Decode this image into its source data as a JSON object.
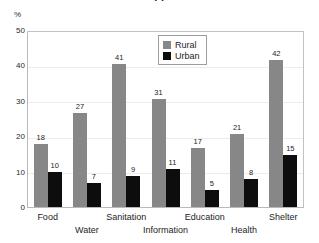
{
  "title_partial": "· ·",
  "axis": {
    "unit_label": "%",
    "y_ticks": [
      "50",
      "40",
      "30",
      "20",
      "10",
      "0"
    ]
  },
  "legend": {
    "position": "inside-top-center",
    "entries": [
      {
        "label": "Rural",
        "color": "#878787",
        "swatch": "rural-swatch"
      },
      {
        "label": "Urban",
        "color": "#0d0d0d",
        "swatch": "urban-swatch"
      }
    ]
  },
  "chart_data": {
    "type": "bar",
    "title": "",
    "xlabel": "",
    "ylabel": "%",
    "ylim": [
      0,
      50
    ],
    "yticks": [
      0,
      10,
      20,
      30,
      40,
      50
    ],
    "grid": true,
    "legend_position": "inside-top-center",
    "categories": [
      "Food",
      "Water",
      "Sanitation",
      "Information",
      "Education",
      "Health",
      "Shelter"
    ],
    "series": [
      {
        "name": "Rural",
        "color": "#878787",
        "values": [
          18,
          27,
          41,
          31,
          17,
          21,
          42
        ]
      },
      {
        "name": "Urban",
        "color": "#0d0d0d",
        "values": [
          10,
          7,
          9,
          11,
          5,
          8,
          15
        ]
      }
    ],
    "data_labels": [
      {
        "category": "Food",
        "rural": "18",
        "urban": "10"
      },
      {
        "category": "Water",
        "rural": "27",
        "urban": "7"
      },
      {
        "category": "Sanitation",
        "rural": "41",
        "urban": "9"
      },
      {
        "category": "Information",
        "rural": "31",
        "urban": "11"
      },
      {
        "category": "Education",
        "rural": "17",
        "urban": "5"
      },
      {
        "category": "Health",
        "rural": "21",
        "urban": "8"
      },
      {
        "category": "Shelter",
        "rural": "42",
        "urban": "15"
      }
    ]
  }
}
